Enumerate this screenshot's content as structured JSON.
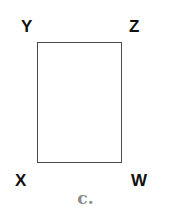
{
  "diagram": {
    "shape": "rectangle",
    "vertices": {
      "top_left": "Y",
      "top_right": "Z",
      "bottom_left": "X",
      "bottom_right": "W"
    },
    "caption": "c.",
    "colors": {
      "outline": "#4a4a4a",
      "labels": "#111111",
      "caption": "#8a8a8a",
      "background": "#ffffff"
    }
  }
}
